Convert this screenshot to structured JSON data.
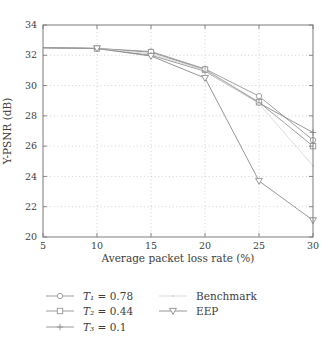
{
  "chart_data": {
    "type": "line",
    "title": "",
    "xlabel": "Average packet loss rate (%)",
    "ylabel": "Y-PSNR (dB)",
    "xlim": [
      5,
      30
    ],
    "ylim": [
      20,
      34
    ],
    "xticks": [
      5,
      10,
      15,
      20,
      25,
      30
    ],
    "yticks": [
      20,
      22,
      24,
      26,
      28,
      30,
      32,
      34
    ],
    "grid": "dotted",
    "legend_position": "below-two-columns",
    "legend_columns": [
      [
        0,
        1,
        2
      ],
      [
        3,
        4
      ]
    ],
    "x": [
      5,
      10,
      15,
      20,
      25,
      30
    ],
    "series": [
      {
        "name": "T₁ = 0.78",
        "marker": "circle",
        "color": "#949494",
        "values": [
          32.5,
          32.45,
          32.25,
          31.1,
          29.3,
          26.4
        ]
      },
      {
        "name": "T₂ = 0.44",
        "marker": "square",
        "color": "#949494",
        "values": [
          32.5,
          32.45,
          32.2,
          31.05,
          28.9,
          26.0
        ]
      },
      {
        "name": "T₃ = 0.1",
        "marker": "plus",
        "color": "#8f8f8f",
        "values": [
          32.5,
          32.45,
          32.0,
          30.95,
          28.85,
          26.9
        ]
      },
      {
        "name": "Benchmark",
        "marker": "dot",
        "color": "#d9d9d9",
        "values": [
          32.5,
          32.45,
          32.1,
          31.0,
          28.8,
          24.7
        ]
      },
      {
        "name": "EEP",
        "marker": "triangle-down",
        "color": "#8a8a8a",
        "values": [
          32.5,
          32.45,
          31.95,
          30.5,
          23.7,
          21.1
        ]
      }
    ],
    "colors": {
      "axis": "#7a7a7a",
      "grid": "#c6c6c6",
      "text": "#3d3d3d",
      "background": "#ffffff"
    }
  }
}
